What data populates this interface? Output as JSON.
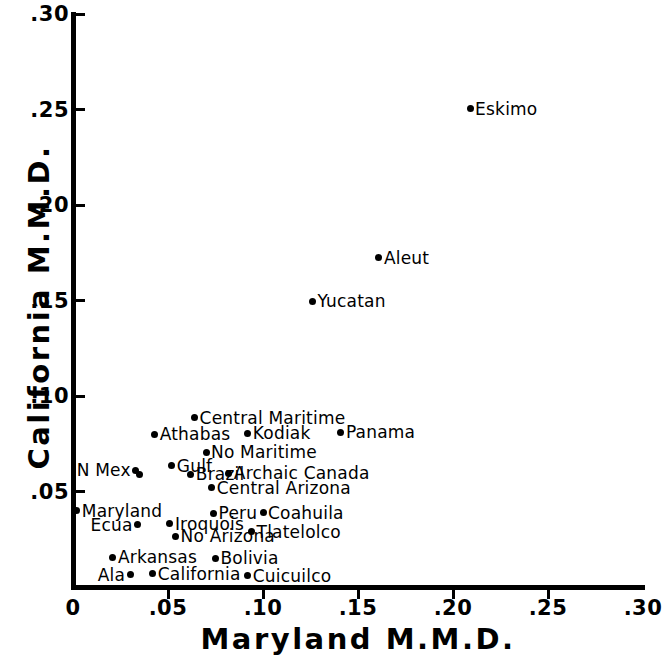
{
  "chart_data": {
    "type": "scatter",
    "title": "",
    "xlabel": "Maryland  M.M.D.",
    "ylabel": "California  M.M.D.",
    "xlim": [
      0,
      0.3
    ],
    "ylim": [
      0,
      0.3
    ],
    "xticks": [
      "0",
      ".05",
      ".10",
      ".15",
      ".20",
      ".25",
      ".30"
    ],
    "xtick_values": [
      0,
      0.05,
      0.1,
      0.15,
      0.2,
      0.25,
      0.3
    ],
    "yticks": [
      ".05",
      ".10",
      ".15",
      ".20",
      ".25",
      ".30"
    ],
    "ytick_values": [
      0.05,
      0.1,
      0.15,
      0.2,
      0.25,
      0.3
    ],
    "grid": false,
    "legend": false,
    "points": [
      {
        "label": "Eskimo",
        "x": 0.209,
        "y": 0.2505,
        "label_side": "right"
      },
      {
        "label": "Aleut",
        "x": 0.161,
        "y": 0.1725,
        "label_side": "right"
      },
      {
        "label": "Yucatan",
        "x": 0.126,
        "y": 0.1495,
        "label_side": "right"
      },
      {
        "label": "Central Maritime",
        "x": 0.064,
        "y": 0.0885,
        "label_side": "right"
      },
      {
        "label": "Athabas",
        "x": 0.043,
        "y": 0.08,
        "label_side": "right"
      },
      {
        "label": "Kodiak",
        "x": 0.092,
        "y": 0.0805,
        "label_side": "right"
      },
      {
        "label": "Panama",
        "x": 0.141,
        "y": 0.081,
        "label_side": "right"
      },
      {
        "label": "No Maritime",
        "x": 0.07,
        "y": 0.0705,
        "label_side": "right"
      },
      {
        "label": "N Mex",
        "x": 0.033,
        "y": 0.061,
        "label_side": "left"
      },
      {
        "label": "",
        "x": 0.035,
        "y": 0.059,
        "label_side": "right"
      },
      {
        "label": "Gulf",
        "x": 0.052,
        "y": 0.0635,
        "label_side": "right"
      },
      {
        "label": "Archaic Canada",
        "x": 0.082,
        "y": 0.0595,
        "label_side": "right"
      },
      {
        "label": "Brazil",
        "x": 0.062,
        "y": 0.059,
        "label_side": "right"
      },
      {
        "label": "Central Arizona",
        "x": 0.073,
        "y": 0.052,
        "label_side": "right"
      },
      {
        "label": "Maryland",
        "x": 0.002,
        "y": 0.04,
        "label_side": "right"
      },
      {
        "label": "Peru",
        "x": 0.074,
        "y": 0.0385,
        "label_side": "right"
      },
      {
        "label": "Coahuila",
        "x": 0.1,
        "y": 0.039,
        "label_side": "right"
      },
      {
        "label": "Ecua",
        "x": 0.034,
        "y": 0.0325,
        "label_side": "left"
      },
      {
        "label": "Iroquois",
        "x": 0.051,
        "y": 0.033,
        "label_side": "right"
      },
      {
        "label": "Tlatelolco",
        "x": 0.094,
        "y": 0.029,
        "label_side": "right"
      },
      {
        "label": "No Arizona",
        "x": 0.054,
        "y": 0.0265,
        "label_side": "right"
      },
      {
        "label": "Arkansas",
        "x": 0.021,
        "y": 0.0155,
        "label_side": "right"
      },
      {
        "label": "Bolivia",
        "x": 0.075,
        "y": 0.015,
        "label_side": "right"
      },
      {
        "label": "Ala",
        "x": 0.03,
        "y": 0.0065,
        "label_side": "left"
      },
      {
        "label": "California",
        "x": 0.042,
        "y": 0.007,
        "label_side": "right"
      },
      {
        "label": "Cuicuilco",
        "x": 0.092,
        "y": 0.006,
        "label_side": "right"
      }
    ]
  },
  "axes": {
    "x_title": "Maryland  M.M.D.",
    "y_title": "California  M.M.D."
  },
  "colors": {
    "foreground": "#000000",
    "background": "#ffffff"
  }
}
